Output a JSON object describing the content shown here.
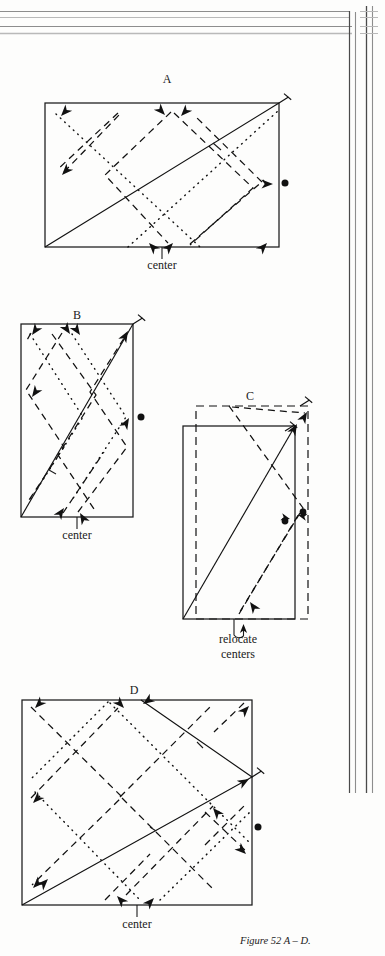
{
  "page": {
    "background_color": "#fdfdfc",
    "ink_color": "#111111"
  },
  "caption": {
    "text": "Figure 52 A – D.",
    "x": 240,
    "y": 943
  },
  "panels": [
    {
      "id": "A",
      "letter": "A",
      "letter_pos": {
        "x": 167,
        "y": 83
      },
      "rect": {
        "x": 45,
        "y": 103,
        "w": 234,
        "h": 144
      },
      "orientation": "landscape",
      "center_label": "center",
      "center_label_pos": {
        "x": 162,
        "y": 268
      },
      "center_tick": {
        "x": 162,
        "y1": 247,
        "y2": 259
      },
      "pin": {
        "x": 279,
        "y": 103
      },
      "dot": {
        "x": 286,
        "y": 183
      },
      "diagonal": {
        "x1": 45,
        "y1": 247,
        "x2": 279,
        "y2": 103
      }
    },
    {
      "id": "B",
      "letter": "B",
      "letter_pos": {
        "x": 77,
        "y": 318
      },
      "rect": {
        "x": 21,
        "y": 324,
        "w": 112,
        "h": 193
      },
      "orientation": "portrait",
      "center_label": "center",
      "center_label_pos": {
        "x": 77,
        "y": 538
      },
      "center_tick": {
        "x": 77,
        "y1": 517,
        "y2": 529
      },
      "pin": {
        "x": 133,
        "y": 324
      },
      "dot": {
        "x": 142,
        "y": 417
      },
      "diagonal": {
        "x1": 21,
        "y1": 517,
        "x2": 133,
        "y2": 324
      }
    },
    {
      "id": "C",
      "letter": "C",
      "letter_pos": {
        "x": 250,
        "y": 396
      },
      "rect": {
        "x": 183,
        "y": 426,
        "w": 112,
        "h": 193
      },
      "shifted_rect": {
        "x": 196,
        "y": 406,
        "w": 112,
        "h": 213
      },
      "orientation": "portrait",
      "center_label_line1": "relocate",
      "center_label_line2": "centers",
      "center_label_pos": {
        "x": 238,
        "y": 640
      },
      "center_label2_pos": {
        "x": 238,
        "y": 655
      },
      "pin_a": {
        "x": 295,
        "y": 426
      },
      "pin_b": {
        "x": 308,
        "y": 406
      },
      "dot_a": {
        "x": 288,
        "y": 519
      },
      "dot_b": {
        "x": 303,
        "y": 513
      },
      "diagonal": {
        "x1": 183,
        "y1": 619,
        "x2": 295,
        "y2": 426
      }
    },
    {
      "id": "D",
      "letter": "D",
      "letter_pos": {
        "x": 134,
        "y": 690
      },
      "rect": {
        "x": 22,
        "y": 700,
        "w": 230,
        "h": 205
      },
      "orientation": "square",
      "center_label": "center",
      "center_label_pos": {
        "x": 137,
        "y": 927
      },
      "center_tick": {
        "x": 137,
        "y1": 905,
        "y2": 917
      },
      "pin": {
        "x": 252,
        "y": 777
      },
      "dot": {
        "x": 259,
        "y": 827
      },
      "bounce_path": [
        {
          "x": 22,
          "y": 905
        },
        {
          "x": 252,
          "y": 777
        },
        {
          "x": 141,
          "y": 700
        }
      ]
    }
  ],
  "scan_artifacts": {
    "top_horizontal_lines_y": [
      11,
      17,
      26,
      33
    ],
    "right_vertical_lines_x": [
      349,
      355,
      366,
      372
    ],
    "vertical_lines_end_y": 793,
    "corner_x": 349
  }
}
